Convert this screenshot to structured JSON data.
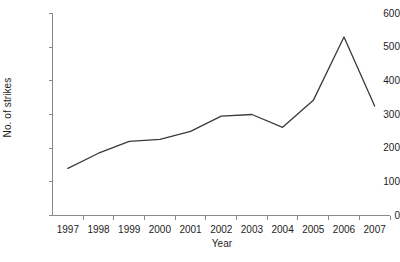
{
  "chart_data": {
    "type": "line",
    "title": "",
    "xlabel": "Year",
    "ylabel": "No. of strikes",
    "categories": [
      "1997",
      "1998",
      "1999",
      "2000",
      "2001",
      "2002",
      "2003",
      "2004",
      "2005",
      "2006",
      "2007"
    ],
    "values": [
      140,
      185,
      220,
      226,
      250,
      295,
      300,
      262,
      342,
      530,
      325
    ],
    "series": [
      {
        "name": "No. of strikes",
        "values": [
          140,
          185,
          220,
          226,
          250,
          295,
          300,
          262,
          342,
          530,
          325
        ]
      }
    ],
    "xlim": [
      1997,
      2007
    ],
    "ylim": [
      0,
      600
    ],
    "ytick_values": [
      0,
      100,
      200,
      300,
      400,
      500,
      600
    ],
    "ytick_labels": [
      "0",
      "100",
      "200",
      "300",
      "400",
      "500",
      "600"
    ],
    "xtick_labels": [
      "1997",
      "1998",
      "1999",
      "2000",
      "2001",
      "2002",
      "2003",
      "2004",
      "2005",
      "2006",
      "2007"
    ],
    "grid": false,
    "legend": false,
    "legend_position": "none",
    "line_color": "#3a3a3a",
    "axis_color": "#8a8a8a",
    "background_color": "#ffffff",
    "annotations": []
  }
}
